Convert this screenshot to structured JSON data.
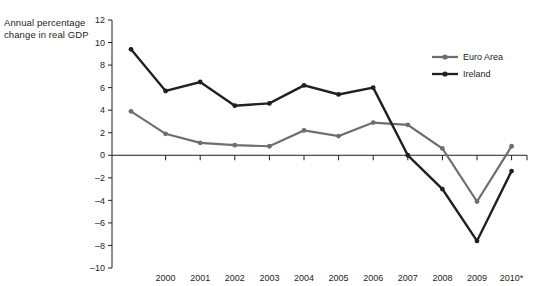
{
  "chart_data": {
    "type": "line",
    "title": "",
    "ylabel": "Annual percentage change in real GDP",
    "xlabel": "",
    "ylim": [
      -10,
      12
    ],
    "ytick_step": 2,
    "yticks": [
      "12",
      "10",
      "8",
      "6",
      "4",
      "2",
      "0",
      "-2",
      "-4",
      "-6",
      "-8",
      "-10"
    ],
    "ytick_values": [
      12,
      10,
      8,
      6,
      4,
      2,
      0,
      -2,
      -4,
      -6,
      -8,
      -10
    ],
    "grid": false,
    "legend_position": "top-right",
    "categories": [
      "",
      "2000",
      "2001",
      "2002",
      "2003",
      "2004",
      "2005",
      "2006",
      "2007",
      "2008",
      "2009",
      "2010*"
    ],
    "x_values": [
      1999,
      2000,
      2001,
      2002,
      2003,
      2004,
      2005,
      2006,
      2007,
      2008,
      2009,
      2010
    ],
    "series": [
      {
        "name": "Euro Area",
        "color": "#6d6e70",
        "values": [
          3.9,
          1.9,
          1.1,
          0.9,
          0.8,
          2.2,
          1.7,
          2.9,
          2.7,
          0.6,
          -4.1,
          0.8
        ]
      },
      {
        "name": "Ireland",
        "color": "#231f20",
        "values": [
          9.4,
          5.7,
          6.5,
          4.4,
          4.6,
          6.2,
          5.4,
          6.0,
          0.0,
          -3.0,
          -7.6,
          -1.4
        ]
      }
    ]
  },
  "axis_title": {
    "line1": "Annual percentage",
    "line2": "change in real GDP"
  },
  "legend": {
    "items": [
      {
        "label": "Euro Area",
        "color": "#6d6e70"
      },
      {
        "label": "Ireland",
        "color": "#231f20"
      }
    ]
  },
  "colors": {
    "axis": "#231f20",
    "euro_area": "#6d6e70",
    "ireland": "#231f20",
    "background": "#ffffff"
  }
}
